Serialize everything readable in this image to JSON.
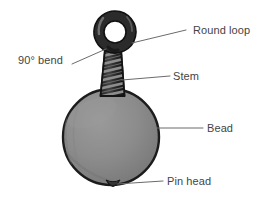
{
  "figure": {
    "background_color": "#ffffff",
    "width": 265,
    "height": 197
  },
  "colors": {
    "wire_dark": "#2b2b2b",
    "wire_outline": "#1a1a1a",
    "wire_highlight": "#8d8d8d",
    "bead_fill": "#8a8a8a",
    "bead_outline": "#1c1c1c",
    "pin_head_fill": "#262626",
    "leader_line": "#6b6b6b",
    "label_text": "#444444"
  },
  "parts": [
    {
      "id": "round-loop",
      "label": "Round loop",
      "shape": "ring",
      "center_x": 115,
      "center_y": 32,
      "outer_radius": 21,
      "inner_radius": 11
    },
    {
      "id": "ninety-degree-bend",
      "label": "90° bend",
      "shape": "bend",
      "point_x": 106,
      "point_y": 49
    },
    {
      "id": "stem",
      "label": "Stem",
      "shape": "twisted-wire",
      "top_y": 50,
      "bottom_y": 95,
      "center_x": 113,
      "wrap_count": 6
    },
    {
      "id": "bead",
      "label": "Bead",
      "shape": "circle",
      "center_x": 111,
      "center_y": 137,
      "radius": 48
    },
    {
      "id": "pin-head",
      "label": "Pin head",
      "shape": "nub",
      "center_x": 113,
      "center_y": 183,
      "width": 13,
      "height": 9
    }
  ],
  "callouts": [
    {
      "id": "round-loop",
      "text": "Round loop",
      "label_x": 193,
      "label_y": 24,
      "leader_from_x": 186,
      "leader_from_y": 30,
      "leader_to_x": 132,
      "leader_to_y": 43
    },
    {
      "id": "ninety-degree-bend",
      "text": "90° bend",
      "label_x": 18,
      "label_y": 54,
      "leader_from_x": 72,
      "leader_from_y": 64,
      "leader_to_x": 106,
      "leader_to_y": 49
    },
    {
      "id": "stem",
      "text": "Stem",
      "label_x": 173,
      "label_y": 70,
      "leader_from_x": 170,
      "leader_from_y": 76,
      "leader_to_x": 122,
      "leader_to_y": 80
    },
    {
      "id": "bead",
      "text": "Bead",
      "label_x": 207,
      "label_y": 122,
      "leader_from_x": 203,
      "leader_from_y": 128,
      "leader_to_x": 157,
      "leader_to_y": 128
    },
    {
      "id": "pin-head",
      "text": "Pin head",
      "label_x": 167,
      "label_y": 175,
      "leader_from_x": 163,
      "leader_from_y": 181,
      "leader_to_x": 117,
      "leader_to_y": 184
    }
  ]
}
